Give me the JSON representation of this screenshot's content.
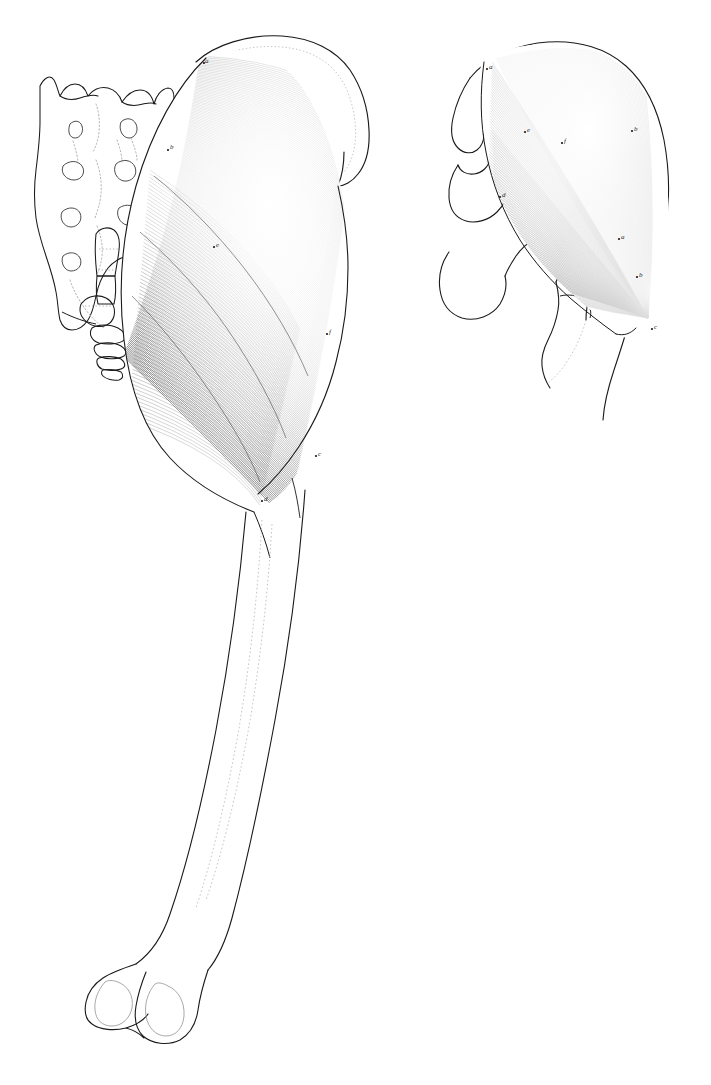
{
  "plate": {
    "title": "",
    "caption": "",
    "background_color": "#ffffff",
    "ink_color": "#1a1a1a",
    "hatch_color": "#3a3a3a",
    "dotted_color": "#9a9a9a",
    "width": 711,
    "height": 1085,
    "medium": "pen-and-ink line engraving",
    "subject": "gluteus maximus muscle, two views"
  },
  "figures": [
    {
      "id": "figure-left",
      "view": "posterior view",
      "description": "Posterior view of gluteus maximus with sacrum, coccyx and full femur",
      "parts": [
        "sacrum",
        "sacral foramina",
        "coccyx",
        "iliac crest",
        "gluteus maximus muscle belly",
        "iliotibial tract",
        "femur shaft",
        "linea aspera",
        "medial femoral condyle",
        "lateral femoral condyle"
      ],
      "labels": [
        {
          "letter": "a",
          "x": 203,
          "y": 62,
          "note": "origin at iliac crest"
        },
        {
          "letter": "b",
          "x": 168,
          "y": 148,
          "note": "sacral origin"
        },
        {
          "letter": "c",
          "x": 316,
          "y": 455,
          "note": "insertion"
        },
        {
          "letter": "d",
          "x": 262,
          "y": 500,
          "note": "gluteal tuberosity"
        },
        {
          "letter": "e",
          "x": 214,
          "y": 246,
          "note": "muscle belly"
        },
        {
          "letter": "f",
          "x": 327,
          "y": 333,
          "note": "lateral border"
        }
      ]
    },
    {
      "id": "figure-right",
      "view": "lateral view",
      "description": "Lateral view of gluteus maximus over pelvis with radiating fibre hatching",
      "parts": [
        "ilium outline",
        "anterior superior iliac spine",
        "acetabular region",
        "ischium",
        "pubis",
        "greater trochanter",
        "femoral shaft",
        "gluteus maximus muscle belly"
      ],
      "labels": [
        {
          "letter": "a",
          "x": 487,
          "y": 68,
          "note": "iliac origin"
        },
        {
          "letter": "b",
          "x": 632,
          "y": 130,
          "note": "posterior border"
        },
        {
          "letter": "c",
          "x": 652,
          "y": 328,
          "note": "insertion on femur"
        },
        {
          "letter": "d",
          "x": 500,
          "y": 196,
          "note": "anterior border"
        },
        {
          "letter": "a2",
          "x": 619,
          "y": 238,
          "note": "fibre convergence"
        },
        {
          "letter": "b2",
          "x": 637,
          "y": 276,
          "note": "tendon"
        },
        {
          "letter": "e",
          "x": 525,
          "y": 131,
          "note": "mid belly"
        },
        {
          "letter": "f",
          "x": 562,
          "y": 142,
          "note": "upper belly"
        }
      ]
    }
  ],
  "annotations": {
    "letters_visible": [
      "a",
      "b",
      "c",
      "d"
    ],
    "letter_style": "small italic serif",
    "count_left": 6,
    "count_right": 8
  }
}
